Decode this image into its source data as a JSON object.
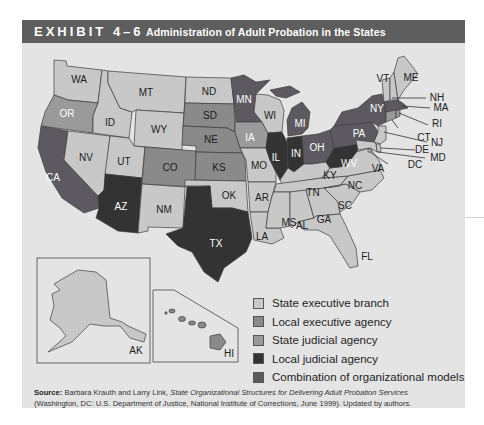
{
  "header": {
    "exhibit_label": "EXHIBIT 4–6",
    "title": "Administration of Adult Probation in the States",
    "background": "#5e5e5e"
  },
  "colors": {
    "state_executive_branch": "#c8c8c8",
    "local_executive_agency": "#8a8a8a",
    "state_judicial_agency": "#9a9a9a",
    "local_judicial_agency": "#333333",
    "combination": "#5c5a60"
  },
  "legend": {
    "items": [
      {
        "key": "state_executive_branch",
        "label": "State executive branch",
        "color": "#c8c8c8"
      },
      {
        "key": "local_executive_agency",
        "label": "Local executive agency",
        "color": "#8a8a8a"
      },
      {
        "key": "state_judicial_agency",
        "label": "State judicial agency",
        "color": "#9a9a9a"
      },
      {
        "key": "local_judicial_agency",
        "label": "Local judicial agency",
        "color": "#333333"
      },
      {
        "key": "combination",
        "label": "Combination of organizational models",
        "color": "#5c5a60"
      }
    ]
  },
  "map": {
    "states": {
      "WA": "state_executive_branch",
      "OR": "state_judicial_agency",
      "CA": "combination",
      "ID": "state_executive_branch",
      "NV": "state_executive_branch",
      "MT": "state_executive_branch",
      "WY": "state_executive_branch",
      "UT": "state_executive_branch",
      "AZ": "local_judicial_agency",
      "CO": "local_executive_agency",
      "NM": "state_executive_branch",
      "ND": "state_executive_branch",
      "SD": "local_executive_agency",
      "NE": "local_executive_agency",
      "KS": "local_executive_agency",
      "OK": "state_executive_branch",
      "TX": "local_judicial_agency",
      "MN": "combination",
      "IA": "state_judicial_agency",
      "MO": "state_executive_branch",
      "AR": "state_executive_branch",
      "LA": "state_executive_branch",
      "WI": "state_executive_branch",
      "IL": "local_judicial_agency",
      "MI": "combination",
      "IN": "local_judicial_agency",
      "OH": "combination",
      "KY": "state_executive_branch",
      "TN": "state_executive_branch",
      "MS": "state_executive_branch",
      "AL": "state_executive_branch",
      "GA": "state_executive_branch",
      "FL": "state_executive_branch",
      "SC": "state_executive_branch",
      "NC": "state_executive_branch",
      "VA": "state_executive_branch",
      "WV": "local_judicial_agency",
      "PA": "combination",
      "NY": "combination",
      "VT": "state_executive_branch",
      "ME": "state_executive_branch",
      "NH": "state_executive_branch",
      "MA": "combination",
      "RI": "state_judicial_agency",
      "CT": "state_judicial_agency",
      "NJ": "state_executive_branch",
      "DE": "state_executive_branch",
      "MD": "state_executive_branch",
      "DC": "state_executive_branch",
      "AK": "state_executive_branch",
      "HI": "local_executive_agency"
    },
    "labels": {
      "WA": "WA",
      "OR": "OR",
      "CA": "CA",
      "ID": "ID",
      "NV": "NV",
      "MT": "MT",
      "WY": "WY",
      "UT": "UT",
      "AZ": "AZ",
      "CO": "CO",
      "NM": "NM",
      "ND": "ND",
      "SD": "SD",
      "NE": "NE",
      "KS": "KS",
      "OK": "OK",
      "TX": "TX",
      "MN": "MN",
      "IA": "IA",
      "MO": "MO",
      "AR": "AR",
      "LA": "LA",
      "WI": "WI",
      "IL": "IL",
      "MI": "MI",
      "IN": "IN",
      "OH": "OH",
      "KY": "KY",
      "TN": "TN",
      "MS": "MS",
      "AL": "AL",
      "GA": "GA",
      "FL": "FL",
      "SC": "SC",
      "NC": "NC",
      "VA": "VA",
      "WV": "WV",
      "PA": "PA",
      "NY": "NY",
      "VT": "VT",
      "ME": "ME",
      "NH": "NH",
      "MA": "MA",
      "RI": "RI",
      "CT": "CT",
      "NJ": "NJ",
      "DE": "DE",
      "MD": "MD",
      "DC": "DC",
      "AK": "AK",
      "HI": "HI"
    }
  },
  "source": {
    "label": "Source:",
    "authors": " Barbara Krauth and Larry Link, ",
    "work_title": "State Organizational Structures for Delivering Adult Probation Services",
    "rest": " (Washington, DC: U.S. Department of Justice, National Institute of Corrections, June 1999). Updated by authors."
  }
}
